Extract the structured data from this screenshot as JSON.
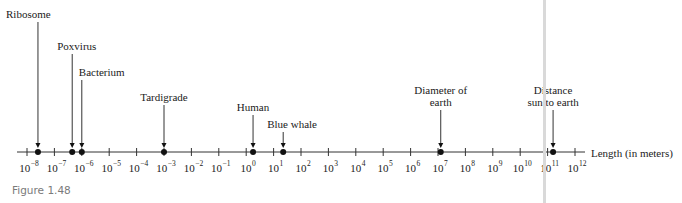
{
  "figure": {
    "caption": "Figure 1.48",
    "axis_title": "Length (in meters)"
  },
  "chart_data": {
    "type": "scatter",
    "title": "",
    "xlabel": "Length (in meters)",
    "ylabel": "",
    "scale": "log10",
    "xlim_exponent": [
      -8,
      12
    ],
    "grid": false,
    "tick_exponents": [
      -8,
      -7,
      -6,
      -5,
      -4,
      -3,
      -2,
      -1,
      0,
      1,
      2,
      3,
      4,
      5,
      6,
      7,
      8,
      9,
      10,
      11,
      12
    ],
    "ticks": [
      {
        "base": "10",
        "exp": "−8"
      },
      {
        "base": "10",
        "exp": "−7"
      },
      {
        "base": "10",
        "exp": "−6"
      },
      {
        "base": "10",
        "exp": "−5"
      },
      {
        "base": "10",
        "exp": "−4"
      },
      {
        "base": "10",
        "exp": "−3"
      },
      {
        "base": "10",
        "exp": "−2"
      },
      {
        "base": "10",
        "exp": "−1"
      },
      {
        "base": "10",
        "exp": "0"
      },
      {
        "base": "10",
        "exp": "1"
      },
      {
        "base": "10",
        "exp": "2"
      },
      {
        "base": "10",
        "exp": "3"
      },
      {
        "base": "10",
        "exp": "4"
      },
      {
        "base": "10",
        "exp": "5"
      },
      {
        "base": "10",
        "exp": "6"
      },
      {
        "base": "10",
        "exp": "7"
      },
      {
        "base": "10",
        "exp": "8"
      },
      {
        "base": "10",
        "exp": "9"
      },
      {
        "base": "10",
        "exp": "10"
      },
      {
        "base": "10",
        "exp": "11"
      },
      {
        "base": "10",
        "exp": "12"
      }
    ],
    "points": [
      {
        "name": "Ribosome",
        "label_lines": [
          "Ribosome"
        ],
        "log10_length": -7.6,
        "label_y": 8,
        "align": "left"
      },
      {
        "name": "Poxvirus",
        "label_lines": [
          "Poxvirus"
        ],
        "log10_length": -6.35,
        "label_y": 40,
        "align": "left"
      },
      {
        "name": "Bacterium",
        "label_lines": [
          "Bacterium"
        ],
        "log10_length": -6.0,
        "label_y": 66,
        "align": "left"
      },
      {
        "name": "Tardigrade",
        "label_lines": [
          "Tardigrade"
        ],
        "log10_length": -3.0,
        "label_y": 91,
        "align": "center"
      },
      {
        "name": "Human",
        "label_lines": [
          "Human"
        ],
        "log10_length": 0.25,
        "label_y": 101,
        "align": "center"
      },
      {
        "name": "Blue whale",
        "label_lines": [
          "Blue whale"
        ],
        "log10_length": 1.35,
        "label_y": 118,
        "align": "left"
      },
      {
        "name": "Diameter of earth",
        "label_lines": [
          "Diameter of",
          "earth"
        ],
        "log10_length": 7.1,
        "label_y": 84,
        "align": "center"
      },
      {
        "name": "Distance sun to earth",
        "label_lines": [
          "Distance",
          "sun to earth"
        ],
        "log10_length": 11.2,
        "label_y": 84,
        "align": "center"
      }
    ]
  }
}
